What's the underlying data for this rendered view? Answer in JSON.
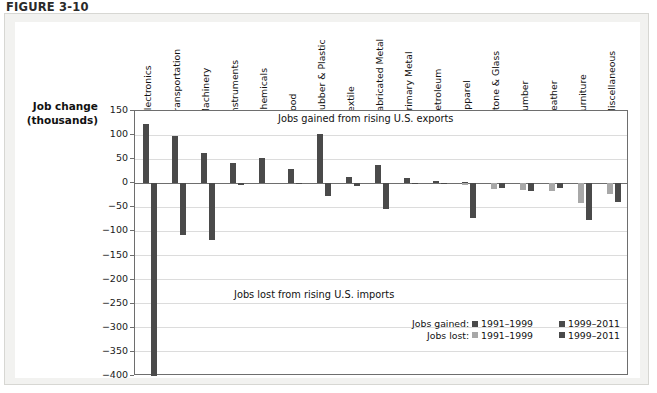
{
  "figure": {
    "number": "FIGURE 3-10"
  },
  "axis": {
    "title_line1": "Job change",
    "title_line2": "(thousands)",
    "yticks": [
      "150",
      "100",
      "50",
      "0",
      "−50",
      "−100",
      "−150",
      "−200",
      "−250",
      "−300",
      "−350",
      "−400"
    ]
  },
  "annotations": {
    "upper_band": "Jobs gained from rising U.S. exports",
    "lower_band": "Jobs lost from rising U.S. imports"
  },
  "legend": {
    "gained_caption": "Jobs gained:",
    "lost_caption": "Jobs lost:",
    "period_early": "1991–1999",
    "period_late": "1999–2011",
    "gained_early_color": "#4a4a4a",
    "gained_late_color": "#4a4a4a",
    "lost_early_color": "#a8a8a8",
    "lost_late_color": "#4a4a4a"
  },
  "colors": {
    "dark_bar": "#4a4a4a",
    "light_bar": "#a8a8a8",
    "panel_bg": "#f2f2f0",
    "plate_bg": "#ffffff",
    "axis_line": "#6e6e6e",
    "gridline": "#dcdcdc"
  },
  "chart_data": {
    "type": "bar",
    "title": "",
    "xlabel": "",
    "ylabel": "Job change (thousands)",
    "ylim": [
      -400,
      150
    ],
    "ytick_values": [
      150,
      100,
      50,
      0,
      -50,
      -100,
      -150,
      -200,
      -250,
      -300,
      -350,
      -400
    ],
    "grid": true,
    "legend_position": "inside-lower-right",
    "categories": [
      "Electronics",
      "Transportation",
      "Machinery",
      "Instruments",
      "Chemicals",
      "Food",
      "Rubber & Plastic",
      "Textile",
      "Fabricated Metal",
      "Primary Metal",
      "Petroleum",
      "Apparel",
      "Stone & Glass",
      "Lumber",
      "Leather",
      "Furniture",
      "Miscellaneous"
    ],
    "series": [
      {
        "name": "Jobs gained: 1991–1999",
        "color": "#4a4a4a",
        "values": [
          122,
          98,
          63,
          43,
          52,
          29,
          45,
          12,
          38,
          75,
          26,
          49,
          12,
          3,
          1,
          0,
          1
        ]
      },
      {
        "name": "Jobs gained: 1999–2011",
        "color": "#4a4a4a",
        "values": [
          0,
          0,
          0,
          0,
          0,
          0,
          0,
          0,
          0,
          0,
          0,
          0,
          0,
          0,
          0,
          0,
          0
        ]
      },
      {
        "name": "Jobs lost: 1991–1999",
        "color": "#a8a8a8",
        "values": [
          0,
          0,
          0,
          0,
          0,
          0,
          0,
          0,
          0,
          0,
          0,
          -3,
          -11,
          -14,
          -17,
          -40,
          -22
        ]
      },
      {
        "name": "Jobs lost: 1999–2011",
        "color": "#4a4a4a",
        "values": [
          -400,
          -108,
          -118,
          -3,
          0,
          -2,
          -27,
          -5,
          -53,
          -2,
          -2,
          -73,
          -10,
          -16,
          -9,
          -77,
          -38
        ]
      }
    ]
  },
  "bars": [
    {
      "category": "Electronics",
      "gained_early": 122,
      "gained_late": 0,
      "lost_early": 0,
      "lost_late": -400
    },
    {
      "category": "Transportation",
      "gained_early": 98,
      "gained_late": 0,
      "lost_early": 0,
      "lost_late": -108
    },
    {
      "category": "Machinery",
      "gained_early": 63,
      "gained_late": 0,
      "lost_early": 0,
      "lost_late": -118
    },
    {
      "category": "Instruments",
      "gained_early": 43,
      "gained_late": 0,
      "lost_early": 0,
      "lost_late": -3
    },
    {
      "category": "Chemicals",
      "gained_early": 52,
      "gained_late": 0,
      "lost_early": 0,
      "lost_late": 0
    },
    {
      "category": "Food",
      "gained_early": 29,
      "gained_late": 0,
      "lost_early": 0,
      "lost_late": -2
    },
    {
      "category": "Rubber & Plastic",
      "gained_early": 102,
      "gained_late": 0,
      "lost_early": 0,
      "lost_late": -27
    },
    {
      "category": "Textile",
      "gained_early": 14,
      "gained_late": 0,
      "lost_early": 0,
      "lost_late": -5
    },
    {
      "category": "Fabricated Metal",
      "gained_early": 38,
      "gained_late": 0,
      "lost_early": 0,
      "lost_late": -53
    },
    {
      "category": "Primary Metal",
      "gained_early": 10,
      "gained_late": 0,
      "lost_early": 0,
      "lost_late": -2
    },
    {
      "category": "Petroleum",
      "gained_early": 5,
      "gained_late": 0,
      "lost_early": 0,
      "lost_late": -2
    },
    {
      "category": "Apparel",
      "gained_early": 2,
      "gained_late": 0,
      "lost_early": -3,
      "lost_late": -73
    },
    {
      "category": "Stone & Glass",
      "gained_early": 1,
      "gained_late": 0,
      "lost_early": -11,
      "lost_late": -10
    },
    {
      "category": "Lumber",
      "gained_early": 1,
      "gained_late": 0,
      "lost_early": -14,
      "lost_late": -16
    },
    {
      "category": "Leather",
      "gained_early": 0,
      "gained_late": 0,
      "lost_early": -17,
      "lost_late": -9
    },
    {
      "category": "Furniture",
      "gained_early": 0,
      "gained_late": 0,
      "lost_early": -40,
      "lost_late": -77
    },
    {
      "category": "Miscellaneous",
      "gained_early": 0,
      "gained_late": 0,
      "lost_early": -22,
      "lost_late": -38
    }
  ]
}
